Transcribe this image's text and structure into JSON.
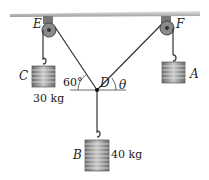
{
  "diagram": {
    "points": {
      "E": "E",
      "F": "F",
      "D": "D"
    },
    "weights": [
      {
        "label": "C",
        "mass": "30 kg"
      },
      {
        "label": "A",
        "mass": ""
      },
      {
        "label": "B",
        "mass": "40 kg"
      }
    ],
    "angles": {
      "left": "60°",
      "right": "θ"
    }
  }
}
